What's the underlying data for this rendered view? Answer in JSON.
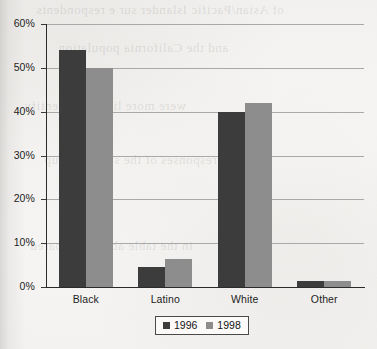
{
  "chart_data": {
    "type": "bar",
    "title": "",
    "subtitle": "",
    "xlabel": "",
    "ylabel": "",
    "categories": [
      "Black",
      "Latino",
      "White",
      "Other"
    ],
    "series": [
      {
        "name": "1996",
        "color": "#3c3c3c",
        "values": [
          54,
          4.5,
          40,
          1.3
        ]
      },
      {
        "name": "1998",
        "color": "#8d8d8d",
        "values": [
          50,
          6.5,
          42,
          1.3
        ]
      }
    ],
    "ylim": [
      0,
      60
    ],
    "ytick_values": [
      0,
      10,
      20,
      30,
      40,
      50,
      60
    ],
    "ytick_labels": [
      "0%",
      "10%",
      "20%",
      "30%",
      "40%",
      "50%",
      "60%"
    ],
    "grid": true,
    "legend_position": "bottom",
    "value_suffix": "%"
  },
  "axis": {
    "gridline_color": "#a9a9a9",
    "axis_color": "#2a2a2a"
  },
  "background": {
    "paper_color": "#f5f4f2",
    "bleed_text": [
      "of Asian/Pacific Islander sur e respondents",
      "and the California population",
      "were more likely to identify",
      "responses of the survey group",
      "in the table above compared"
    ]
  }
}
